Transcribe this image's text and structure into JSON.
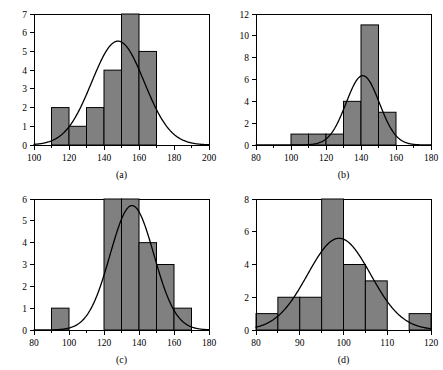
{
  "figure": {
    "background": "#ffffff",
    "bar_fill": "#808080",
    "bar_stroke": "#000000",
    "curve_color": "#000000",
    "axis_color": "#000000"
  },
  "chart_data": [
    {
      "type": "bar",
      "panel": "a",
      "caption": "(a)",
      "title": "",
      "xlabel": "",
      "ylabel": "",
      "xlim": [
        100,
        200
      ],
      "ylim": [
        0,
        7
      ],
      "bin_width": 10,
      "x_major_ticks": [
        100,
        120,
        140,
        160,
        180,
        200
      ],
      "x_minor_ticks": [
        110,
        130,
        150,
        170,
        190
      ],
      "x_tick_labels": [
        "100",
        "120",
        "140",
        "160",
        "180",
        "200"
      ],
      "y_ticks": [
        0,
        1,
        2,
        3,
        4,
        5,
        6,
        7
      ],
      "y_tick_labels": [
        "0",
        "1",
        "2",
        "3",
        "4",
        "5",
        "6",
        "7"
      ],
      "grid": false,
      "legend": null,
      "bin_edges": [
        100,
        110,
        120,
        130,
        140,
        150,
        160,
        170,
        180,
        190,
        200
      ],
      "values": [
        0,
        2,
        1,
        2,
        4,
        7,
        5,
        0,
        0,
        0
      ],
      "curve": {
        "kind": "normal-density-scaled",
        "mean": 148,
        "sd": 15,
        "peak": 5.55,
        "peak_x": 148
      }
    },
    {
      "type": "bar",
      "panel": "b",
      "caption": "(b)",
      "title": "",
      "xlabel": "",
      "ylabel": "",
      "xlim": [
        80,
        180
      ],
      "ylim": [
        0,
        12
      ],
      "bin_width": 10,
      "x_major_ticks": [
        80,
        100,
        120,
        140,
        160,
        180
      ],
      "x_minor_ticks": [
        90,
        110,
        130,
        150,
        170
      ],
      "x_tick_labels": [
        "80",
        "100",
        "120",
        "140",
        "160",
        "180"
      ],
      "y_ticks": [
        0,
        2,
        4,
        6,
        8,
        10,
        12
      ],
      "y_tick_labels": [
        "0",
        "2",
        "4",
        "6",
        "8",
        "10",
        "12"
      ],
      "grid": false,
      "legend": null,
      "bin_edges": [
        80,
        90,
        100,
        110,
        120,
        130,
        140,
        150,
        160,
        170,
        180
      ],
      "values": [
        0,
        0,
        1,
        1,
        1,
        4,
        11,
        3,
        0,
        0
      ],
      "curve": {
        "kind": "normal-density-scaled",
        "mean": 141,
        "sd": 9.5,
        "peak": 6.35,
        "peak_x": 141
      }
    },
    {
      "type": "bar",
      "panel": "c",
      "caption": "(c)",
      "title": "",
      "xlabel": "",
      "ylabel": "",
      "xlim": [
        80,
        180
      ],
      "ylim": [
        0,
        6
      ],
      "bin_width": 10,
      "x_major_ticks": [
        80,
        100,
        120,
        140,
        160,
        180
      ],
      "x_minor_ticks": [
        90,
        110,
        130,
        150,
        170
      ],
      "x_tick_labels": [
        "80",
        "100",
        "120",
        "140",
        "160",
        "180"
      ],
      "y_ticks": [
        0,
        1,
        2,
        3,
        4,
        5,
        6
      ],
      "y_tick_labels": [
        "0",
        "1",
        "2",
        "3",
        "4",
        "5",
        "6"
      ],
      "grid": false,
      "legend": null,
      "bin_edges": [
        80,
        90,
        100,
        110,
        120,
        130,
        140,
        150,
        160,
        170,
        180
      ],
      "values": [
        0,
        1,
        0,
        0,
        6,
        6,
        4,
        3,
        1,
        0
      ],
      "curve": {
        "kind": "normal-density-scaled",
        "mean": 136,
        "sd": 12.5,
        "peak": 5.7,
        "peak_x": 136
      }
    },
    {
      "type": "bar",
      "panel": "d",
      "caption": "(d)",
      "title": "",
      "xlabel": "",
      "ylabel": "",
      "xlim": [
        80,
        120
      ],
      "ylim": [
        0,
        8
      ],
      "bin_width": 5,
      "x_major_ticks": [
        80,
        90,
        100,
        110,
        120
      ],
      "x_minor_ticks": [
        85,
        95,
        105,
        115
      ],
      "x_tick_labels": [
        "80",
        "90",
        "100",
        "110",
        "120"
      ],
      "y_ticks": [
        0,
        2,
        4,
        6,
        8
      ],
      "y_tick_labels": [
        "0",
        "2",
        "4",
        "6",
        "8"
      ],
      "grid": false,
      "legend": null,
      "bin_edges": [
        80,
        85,
        90,
        95,
        100,
        105,
        110,
        115,
        120
      ],
      "values": [
        1,
        2,
        2,
        8,
        4,
        3,
        0,
        1
      ],
      "curve": {
        "kind": "normal-density-scaled",
        "mean": 99,
        "sd": 7.2,
        "peak": 5.6,
        "peak_x": 99
      }
    }
  ]
}
